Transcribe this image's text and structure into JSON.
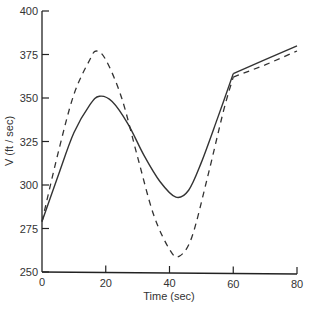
{
  "chart_data": {
    "type": "line",
    "title": "",
    "xlabel": "Time (sec)",
    "ylabel": "V (ft / sec)",
    "xlim": [
      0,
      80
    ],
    "ylim": [
      250,
      400
    ],
    "xticks": [
      0,
      20,
      40,
      60,
      80
    ],
    "yticks": [
      250,
      275,
      300,
      325,
      350,
      375,
      400
    ],
    "grid": false,
    "legend": null,
    "series": [
      {
        "name": "solid",
        "style": "solid",
        "x": [
          0,
          5,
          10,
          15,
          18,
          22,
          27,
          32,
          37,
          42,
          46,
          50,
          55,
          60,
          70,
          80
        ],
        "y": [
          279,
          305,
          330,
          346,
          351,
          348,
          335,
          317,
          302,
          293,
          297,
          313,
          338,
          364,
          372,
          380
        ]
      },
      {
        "name": "dashed",
        "style": "dashed",
        "x": [
          0,
          5,
          10,
          15,
          17,
          20,
          25,
          30,
          35,
          40,
          43,
          47,
          52,
          57,
          60,
          70,
          80
        ],
        "y": [
          279,
          318,
          352,
          372,
          377,
          372,
          350,
          316,
          283,
          263,
          259,
          270,
          305,
          343,
          362,
          369,
          377
        ]
      }
    ]
  }
}
